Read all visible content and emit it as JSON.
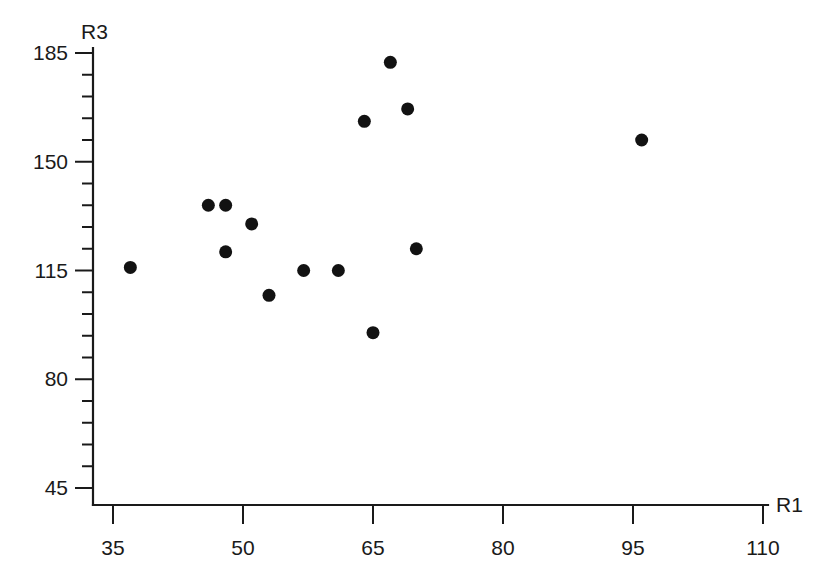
{
  "chart_data": {
    "type": "scatter",
    "title": "",
    "xlabel": "R1",
    "ylabel": "R3",
    "xlim": [
      30.5,
      112.5
    ],
    "ylim": [
      40,
      190
    ],
    "grid": false,
    "legend": null,
    "x_ticks": [
      35,
      50,
      65,
      80,
      95,
      110
    ],
    "y_ticks": [
      45,
      80,
      115,
      150,
      185
    ],
    "x_tick_labels": [
      "35",
      "50",
      "65",
      "80",
      "95",
      "110"
    ],
    "y_tick_labels": [
      "45",
      "80",
      "115",
      "150",
      "185"
    ],
    "x_minor_tick_count_between": 0,
    "y_minor_tick_count_between": 4,
    "marker": "filled-circle",
    "marker_color": "#121212",
    "marker_size_px": 13,
    "points": [
      {
        "x": 37,
        "y": 116
      },
      {
        "x": 46,
        "y": 136
      },
      {
        "x": 48,
        "y": 136
      },
      {
        "x": 48,
        "y": 121
      },
      {
        "x": 51,
        "y": 130
      },
      {
        "x": 53,
        "y": 107
      },
      {
        "x": 57,
        "y": 115
      },
      {
        "x": 61,
        "y": 115
      },
      {
        "x": 64,
        "y": 163
      },
      {
        "x": 65,
        "y": 95
      },
      {
        "x": 67,
        "y": 182
      },
      {
        "x": 69,
        "y": 167
      },
      {
        "x": 70,
        "y": 122
      },
      {
        "x": 96,
        "y": 157
      }
    ]
  },
  "axes": {
    "y_axis_title": "R3",
    "x_axis_title": "R1"
  },
  "colors": {
    "axis": "#1a1a1a",
    "marker": "#121212",
    "background": "#ffffff"
  }
}
